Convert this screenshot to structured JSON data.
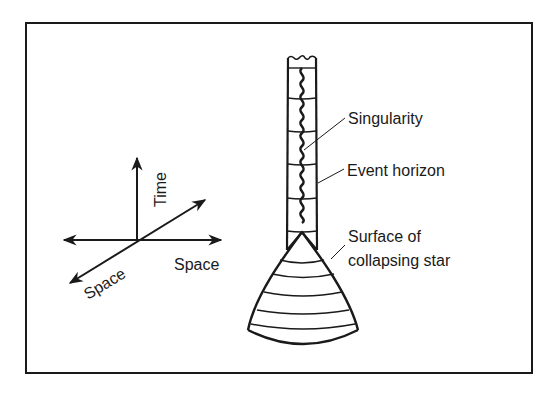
{
  "diagram": {
    "axes": {
      "time_label": "Time",
      "space_horizontal_label": "Space",
      "space_depth_label": "Space"
    },
    "labels": {
      "singularity": "Singularity",
      "event_horizon": "Event horizon",
      "surface_line1": "Surface of",
      "surface_line2": "collapsing star"
    },
    "colors": {
      "ink": "#1a1a1a",
      "background": "#ffffff"
    }
  }
}
